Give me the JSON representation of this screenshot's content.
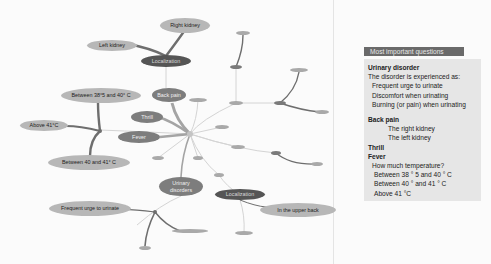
{
  "diagram": {
    "type": "mind-map",
    "hub": {
      "x": 190,
      "y": 134
    },
    "nodes": [
      {
        "id": "right-kidney",
        "label": "Right kidney",
        "x": 185,
        "y": 25,
        "w": 50,
        "h": 15,
        "tone": "light"
      },
      {
        "id": "left-kidney",
        "label": "Left kidney",
        "x": 112,
        "y": 46,
        "w": 50,
        "h": 11,
        "tone": "light"
      },
      {
        "id": "localization-top",
        "label": "Localization",
        "x": 166,
        "y": 61,
        "w": 50,
        "h": 12,
        "tone": "dark"
      },
      {
        "id": "back-pain",
        "label": "Back pain",
        "x": 169,
        "y": 95,
        "w": 34,
        "h": 14,
        "tone": "mid"
      },
      {
        "id": "between-38-40",
        "label": "Between 38°5 and 40° C",
        "x": 101,
        "y": 96,
        "w": 80,
        "h": 15,
        "tone": "light"
      },
      {
        "id": "thrill",
        "label": "Thrill",
        "x": 147,
        "y": 117,
        "w": 32,
        "h": 12,
        "tone": "mid"
      },
      {
        "id": "above-41",
        "label": "Above 41°C",
        "x": 44,
        "y": 126,
        "w": 48,
        "h": 11,
        "tone": "light"
      },
      {
        "id": "fever",
        "label": "Fever",
        "x": 139,
        "y": 137,
        "w": 42,
        "h": 12,
        "tone": "mid"
      },
      {
        "id": "between-40-41",
        "label": "Between 40 and 41° C",
        "x": 89,
        "y": 163,
        "w": 82,
        "h": 15,
        "tone": "light"
      },
      {
        "id": "urinary-disorders",
        "label": "Urinary disorders",
        "x": 181,
        "y": 186,
        "w": 44,
        "h": 19,
        "tone": "mid"
      },
      {
        "id": "frequent-urge",
        "label": "Frequent urge to urinate",
        "x": 70,
        "y": 209,
        "w": 82,
        "h": 15,
        "tone": "light"
      },
      {
        "id": "localization-bottom",
        "label": "Localization",
        "x": 240,
        "y": 195,
        "w": 50,
        "h": 11,
        "tone": "dark"
      },
      {
        "id": "upper-back",
        "label": "In the upper back",
        "x": 298,
        "y": 210,
        "w": 76,
        "h": 14,
        "tone": "light"
      }
    ],
    "pills": [
      {
        "x": 243,
        "y": 33,
        "w": 14
      },
      {
        "x": 236,
        "y": 67,
        "w": 12,
        "dark": true
      },
      {
        "x": 236,
        "y": 103,
        "w": 14
      },
      {
        "x": 299,
        "y": 70,
        "w": 18
      },
      {
        "x": 280,
        "y": 103,
        "w": 12,
        "dark": true
      },
      {
        "x": 322,
        "y": 112,
        "w": 14
      },
      {
        "x": 198,
        "y": 100,
        "w": 18
      },
      {
        "x": 222,
        "y": 127,
        "w": 14
      },
      {
        "x": 238,
        "y": 147,
        "w": 14
      },
      {
        "x": 276,
        "y": 153,
        "w": 10,
        "dark": true
      },
      {
        "x": 317,
        "y": 164,
        "w": 12
      },
      {
        "x": 158,
        "y": 158,
        "w": 12
      },
      {
        "x": 198,
        "y": 158,
        "w": 10
      },
      {
        "x": 219,
        "y": 175,
        "w": 10
      },
      {
        "x": 244,
        "y": 233,
        "w": 18
      },
      {
        "x": 190,
        "y": 231,
        "w": 36
      },
      {
        "x": 145,
        "y": 248,
        "w": 12
      }
    ]
  },
  "panel": {
    "header": "Most important questions",
    "sections": [
      {
        "title": "Urinary disorder",
        "lines": [
          {
            "text": "The disorder is experienced as:",
            "indent": 0
          },
          {
            "text": "Frequent urge to urinate",
            "indent": 1
          },
          {
            "text": "Discomfort when urinating",
            "indent": 1
          },
          {
            "text": "Burning (or pain) when urinating",
            "indent": 1
          }
        ]
      },
      {
        "title": "Back pain",
        "lines": [
          {
            "text": "The right kidney",
            "indent": 3
          },
          {
            "text": "The left kidney",
            "indent": 3
          }
        ]
      },
      {
        "title": "Thrill",
        "lines": []
      },
      {
        "title": "Fever",
        "lines": [
          {
            "text": "How much temperature?",
            "indent": 1
          },
          {
            "text": "Between  38 ° 5 and 40 ° C",
            "indent": 2
          },
          {
            "text": "Between  40 ° and 41 ° C",
            "indent": 2
          },
          {
            "text": "Above 41 °C",
            "indent": 2
          }
        ]
      }
    ]
  },
  "colors": {
    "background": "#fbfbfb",
    "edge_light": "#d2d2d2",
    "edge_mid": "#a8a8a8",
    "edge_dark": "#6e6e6e",
    "node_light": "#b7b7b7",
    "node_mid": "#7d7d7d",
    "node_dark": "#555555",
    "panel_header": "#6a6a6a",
    "panel_body": "#e6e6e6"
  }
}
